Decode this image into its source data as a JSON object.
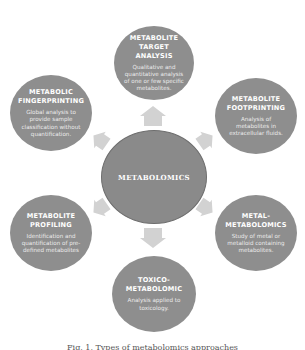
{
  "diagram": {
    "center": {
      "label": "METABOLOMICS"
    },
    "nodes": [
      {
        "id": "target",
        "title_line1": "METABOLITE",
        "title_line2": "TARGET ANALYSIS",
        "description": "Qualitative and quantitative analysis of one or few specific metabolites."
      },
      {
        "id": "fingerprinting",
        "title_line1": "METABOLIC",
        "title_line2": "FINGERPRINTING",
        "description": "Global analysis to provide sample classification without quantification."
      },
      {
        "id": "footprinting",
        "title_line1": "METABOLITE",
        "title_line2": "FOOTPRINTING",
        "description": "Analysis of metabolites in extracellular fluids."
      },
      {
        "id": "profiling",
        "title_line1": "METABOLITE",
        "title_line2": "PROFILING",
        "description": "Identification and quantification of pre-defined metabolites"
      },
      {
        "id": "metal",
        "title_line1": "METAL-",
        "title_line2": "METABOLOMICS",
        "description": "Study of metal or metalloid containing metabolites."
      },
      {
        "id": "toxico",
        "title_line1": "TOXICO-",
        "title_line2": "METABOLOMIC",
        "description": "Analysis applied to toxicology."
      }
    ],
    "edges": [
      {
        "from": "center",
        "to": "target"
      },
      {
        "from": "center",
        "to": "fingerprinting"
      },
      {
        "from": "center",
        "to": "footprinting"
      },
      {
        "from": "center",
        "to": "profiling"
      },
      {
        "from": "center",
        "to": "metal"
      },
      {
        "from": "center",
        "to": "toxico"
      }
    ],
    "colors": {
      "node_fill": "#8e8e8e",
      "center_fill": "#8a8a8a",
      "arrow_fill": "#d2d2d2",
      "text": "#ffffff"
    }
  },
  "caption": {
    "text": "Fig. 1. Types of metabolomics approaches"
  }
}
